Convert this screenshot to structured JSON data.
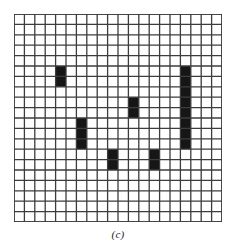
{
  "figure": {
    "caption": "(c)",
    "type": "grid-bitmap-diagram"
  },
  "grid": {
    "columns": 20,
    "rows": 20,
    "cell_size_px": 10.4,
    "line_color": "#3c3c3c",
    "cell_color": "#ffffff",
    "fill_color": "#161616",
    "border_color": "#3c3c3c",
    "line_width_px": 1.3,
    "border_width_px": 1.6
  },
  "chart_data": {
    "type": "heatmap",
    "title": "(c)",
    "xlabel": "",
    "ylabel": "",
    "grid": true,
    "legend": "none",
    "columns": 20,
    "rows": 20,
    "xlim": [
      0,
      20
    ],
    "ylim": [
      0,
      20
    ],
    "filled_blocks": [
      {
        "name": "block-a",
        "col": 4,
        "row": 5,
        "width": 1,
        "height": 2
      },
      {
        "name": "block-b",
        "col": 16,
        "row": 5,
        "width": 1,
        "height": 8
      },
      {
        "name": "block-c",
        "col": 11,
        "row": 8,
        "width": 1,
        "height": 2
      },
      {
        "name": "block-d",
        "col": 6,
        "row": 10,
        "width": 1,
        "height": 3
      },
      {
        "name": "block-e",
        "col": 9,
        "row": 13,
        "width": 1,
        "height": 2
      },
      {
        "name": "block-f",
        "col": 13,
        "row": 13,
        "width": 1,
        "height": 2
      }
    ]
  }
}
